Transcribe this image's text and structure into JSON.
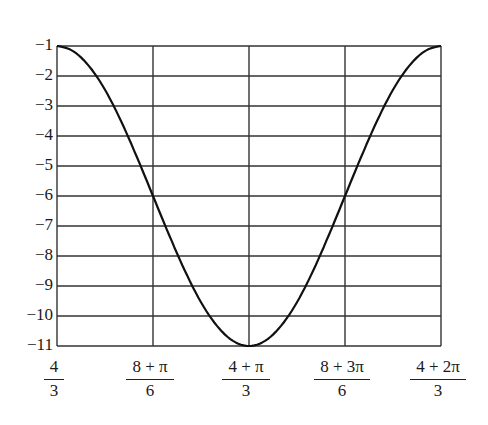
{
  "chart_data": {
    "type": "line",
    "title": "",
    "xlabel": "",
    "ylabel": "",
    "grid": true,
    "legend": null,
    "ylim": [
      -11,
      -1
    ],
    "xlim_labels": [
      "4/3",
      "(4+2π)/3"
    ],
    "x_ticks": [
      {
        "num": "4",
        "den": "3",
        "value": 1.3333
      },
      {
        "num": "8 + π",
        "den": "6",
        "value": 1.8569
      },
      {
        "num": "4 + π",
        "den": "3",
        "value": 2.3805
      },
      {
        "num": "8 + 3π",
        "den": "6",
        "value": 2.9041
      },
      {
        "num": "4 + 2π",
        "den": "3",
        "value": 3.4277
      }
    ],
    "y_ticks": [
      {
        "label": "−1",
        "value": -1
      },
      {
        "label": "−2",
        "value": -2
      },
      {
        "label": "−3",
        "value": -3
      },
      {
        "label": "−4",
        "value": -4
      },
      {
        "label": "−5",
        "value": -5
      },
      {
        "label": "−6",
        "value": -6
      },
      {
        "label": "−7",
        "value": -7
      },
      {
        "label": "−8",
        "value": -8
      },
      {
        "label": "−9",
        "value": -9
      },
      {
        "label": "−10",
        "value": -10
      },
      {
        "label": "−11",
        "value": -11
      }
    ],
    "series": [
      {
        "name": "curve",
        "color": "#111111",
        "x": [
          1.3333,
          1.4206,
          1.5079,
          1.5951,
          1.6824,
          1.7697,
          1.8569,
          1.9442,
          2.0315,
          2.1187,
          2.206,
          2.2933,
          2.3805,
          2.4678,
          2.5551,
          2.6423,
          2.7296,
          2.8169,
          2.9041,
          2.9914,
          3.0787,
          3.1659,
          3.2532,
          3.3405,
          3.4277
        ],
        "y": [
          -1.0,
          -1.17,
          -1.67,
          -2.46,
          -3.5,
          -4.71,
          -6.0,
          -7.29,
          -8.5,
          -9.54,
          -10.33,
          -10.83,
          -11.0,
          -10.83,
          -10.33,
          -9.54,
          -8.5,
          -7.29,
          -6.0,
          -4.71,
          -3.5,
          -2.46,
          -1.67,
          -1.17,
          -1.0
        ]
      }
    ],
    "colors": {
      "grid": "#333333",
      "curve": "#111111",
      "background": "#ffffff"
    }
  }
}
